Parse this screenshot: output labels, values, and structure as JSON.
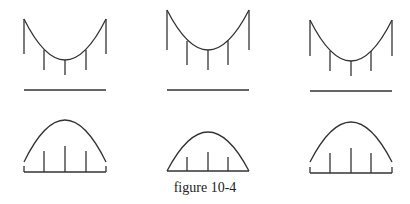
{
  "figure": {
    "caption": "figure 10-4",
    "rows": [
      {
        "name": "sagging-curves-row",
        "count": 3,
        "description": "U-shaped curves supported by vertical rods above a horizontal baseline"
      },
      {
        "name": "arch-curves-row",
        "count": 3,
        "description": "Arch-shaped curves with vertical rods standing on a base"
      }
    ],
    "line_color": "#333333"
  }
}
